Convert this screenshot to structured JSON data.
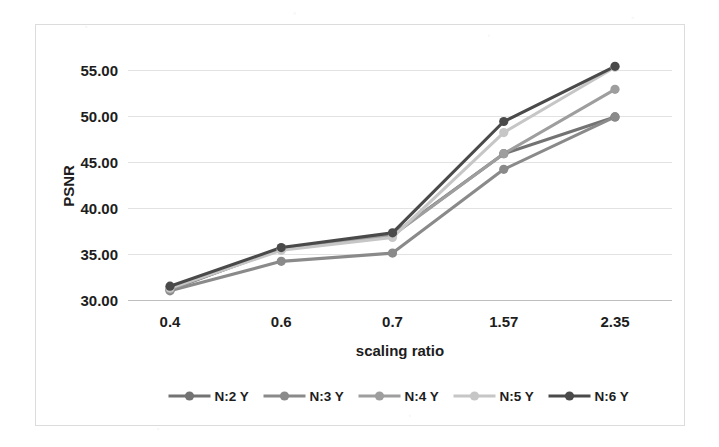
{
  "chart_data": {
    "type": "line",
    "title": "",
    "subtitle": "",
    "xlabel": "scaling ratio",
    "ylabel": "PSNR",
    "categories": [
      "0.4",
      "0.6",
      "0.7",
      "1.57",
      "2.35"
    ],
    "x_tick_labels": [
      "0.4",
      "0.6",
      "0.7",
      "1.57",
      "2.35"
    ],
    "y_tick_labels": [
      "30.00",
      "35.00",
      "40.00",
      "45.00",
      "50.00",
      "55.00"
    ],
    "y_ticks": [
      30,
      35,
      40,
      45,
      50,
      55
    ],
    "ylim": [
      30,
      57
    ],
    "grid": "horizontal",
    "legend_position": "bottom",
    "markers": "circle",
    "series": [
      {
        "name": "N:2 Y",
        "color": "#737373",
        "values": [
          31.1,
          35.6,
          37.1,
          45.9,
          49.9
        ]
      },
      {
        "name": "N:3 Y",
        "color": "#8a8a8a",
        "values": [
          31.0,
          34.2,
          35.1,
          44.2,
          49.9
        ]
      },
      {
        "name": "N:4 Y",
        "color": "#9e9e9e",
        "values": [
          31.2,
          35.5,
          37.0,
          45.9,
          52.9
        ]
      },
      {
        "name": "N:5 Y",
        "color": "#c6c6c6",
        "values": [
          31.3,
          35.4,
          36.8,
          48.2,
          55.3
        ]
      },
      {
        "name": "N:6 Y",
        "color": "#4a4a4a",
        "values": [
          31.5,
          35.7,
          37.3,
          49.4,
          55.4
        ]
      }
    ]
  },
  "legend": {
    "items": [
      {
        "label": "N:2 Y",
        "color": "#737373"
      },
      {
        "label": "N:3 Y",
        "color": "#8a8a8a"
      },
      {
        "label": "N:4 Y",
        "color": "#9e9e9e"
      },
      {
        "label": "N:5 Y",
        "color": "#c6c6c6"
      },
      {
        "label": "N:6 Y",
        "color": "#4a4a4a"
      }
    ]
  },
  "style": {
    "border_color": "#dcdcdc",
    "grid_color": "#e2e2e2",
    "text_color": "#1d1d1d",
    "background": "#ffffff"
  }
}
